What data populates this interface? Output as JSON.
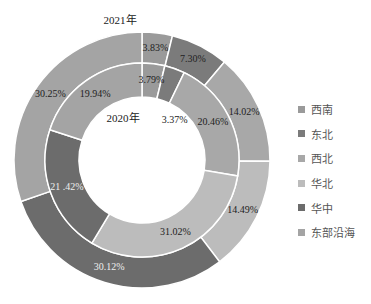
{
  "chart_data": {
    "type": "pie",
    "subtype": "nested-donut",
    "categories": [
      "西南",
      "东北",
      "西北",
      "华北",
      "华中",
      "东部沿海"
    ],
    "series": [
      {
        "name": "2021年",
        "ring": "outer",
        "values": [
          3.83,
          7.3,
          14.02,
          14.49,
          30.12,
          30.25
        ]
      },
      {
        "name": "2020年",
        "ring": "inner",
        "values": [
          3.79,
          3.37,
          20.46,
          31.02,
          21.42,
          19.94
        ]
      }
    ],
    "labels": {
      "outer": [
        "3.83%",
        "7.30%",
        "14.02%",
        "14.49%",
        "30.12%",
        "30.25%"
      ],
      "inner": [
        "3.79%",
        "3.37%",
        "20.46%",
        "31.02%",
        "21 .42%",
        "19.94%"
      ]
    },
    "colors": [
      "#9a9a9a",
      "#7b7b7b",
      "#a8a8a8",
      "#bcbcbc",
      "#6c6c6c",
      "#a4a4a4"
    ],
    "title": "",
    "legend_position": "right"
  },
  "ring_titles": {
    "outer": "2021年",
    "inner": "2020年"
  },
  "legend": [
    {
      "label": "西南",
      "color": "#9a9a9a"
    },
    {
      "label": "东北",
      "color": "#7b7b7b"
    },
    {
      "label": "西北",
      "color": "#a8a8a8"
    },
    {
      "label": "华北",
      "color": "#bcbcbc"
    },
    {
      "label": "华中",
      "color": "#6c6c6c"
    },
    {
      "label": "东部沿海",
      "color": "#a4a4a4"
    }
  ]
}
